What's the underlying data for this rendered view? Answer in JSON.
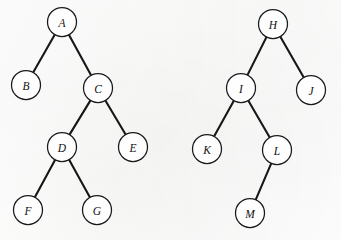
{
  "figure": {
    "background_color": "#fdfdfc",
    "stroke_color": "#171717",
    "node_fill_color": "#fefefe",
    "node_radius": 14.5,
    "canvas": {
      "width": 341,
      "height": 240
    }
  },
  "trees": [
    {
      "id": "left-tree",
      "name": "tree-left",
      "root": "A",
      "nodes": [
        {
          "id": "A",
          "label": "A",
          "cx": 62,
          "cy": 22
        },
        {
          "id": "B",
          "label": "B",
          "cx": 26,
          "cy": 85
        },
        {
          "id": "C",
          "label": "C",
          "cx": 98,
          "cy": 88
        },
        {
          "id": "D",
          "label": "D",
          "cx": 62,
          "cy": 147
        },
        {
          "id": "E",
          "label": "E",
          "cx": 133,
          "cy": 147
        },
        {
          "id": "F",
          "label": "F",
          "cx": 28,
          "cy": 210
        },
        {
          "id": "G",
          "label": "G",
          "cx": 97,
          "cy": 210
        }
      ],
      "edges": [
        {
          "from": "A",
          "to": "B"
        },
        {
          "from": "A",
          "to": "C"
        },
        {
          "from": "C",
          "to": "D"
        },
        {
          "from": "C",
          "to": "E"
        },
        {
          "from": "D",
          "to": "F"
        },
        {
          "from": "D",
          "to": "G"
        }
      ]
    },
    {
      "id": "right-tree",
      "name": "tree-right",
      "root": "H",
      "nodes": [
        {
          "id": "H",
          "label": "H",
          "cx": 273,
          "cy": 24
        },
        {
          "id": "I",
          "label": "I",
          "cx": 241,
          "cy": 88
        },
        {
          "id": "J",
          "label": "J",
          "cx": 311,
          "cy": 90
        },
        {
          "id": "K",
          "label": "K",
          "cx": 207,
          "cy": 149
        },
        {
          "id": "L",
          "label": "L",
          "cx": 277,
          "cy": 150
        },
        {
          "id": "M",
          "label": "M",
          "cx": 250,
          "cy": 213
        }
      ],
      "edges": [
        {
          "from": "H",
          "to": "I"
        },
        {
          "from": "H",
          "to": "J"
        },
        {
          "from": "I",
          "to": "K"
        },
        {
          "from": "I",
          "to": "L"
        },
        {
          "from": "L",
          "to": "M"
        }
      ]
    }
  ]
}
